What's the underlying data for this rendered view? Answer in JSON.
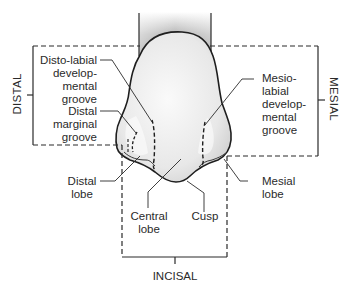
{
  "diagram": {
    "colors": {
      "line": "#2a2a2a",
      "crown_fill": "#ededed",
      "root_shade": "#8a8a8a",
      "background": "#ffffff"
    },
    "regions": {
      "distal": "DISTAL",
      "mesial": "MESIAL",
      "incisal": "INCISAL"
    },
    "labels": {
      "disto_labial": [
        "Disto-labial",
        "develop-",
        "mental",
        "groove"
      ],
      "distal_marginal": [
        "Distal",
        "marginal",
        "groove"
      ],
      "distal_lobe": [
        "Distal",
        "lobe"
      ],
      "central_lobe": [
        "Central",
        "lobe"
      ],
      "cusp": [
        "Cusp"
      ],
      "mesial_lobe": [
        "Mesial",
        "lobe"
      ],
      "mesio_labial": [
        "Mesio-",
        "labial",
        "develop-",
        "mental",
        "groove"
      ]
    }
  }
}
